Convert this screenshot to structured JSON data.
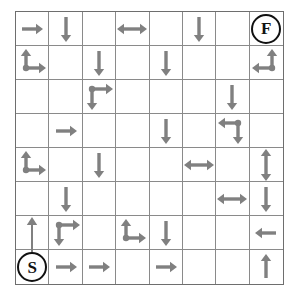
{
  "puzzle": {
    "title": "Arrow Maze",
    "rows": 8,
    "cols": 8,
    "start_label": "S",
    "finish_label": "F",
    "colors": {
      "arrow": "#808080",
      "grid_line": "#8a8a8a",
      "border": "#6e6e6e",
      "marker": "#111111",
      "background": "#ffffff"
    },
    "legend": {
      "right": "right-arrow",
      "left": "left-arrow",
      "up": "up-arrow",
      "down": "down-arrow",
      "left-right": "left-right-double-arrow",
      "up-down": "up-down-double-arrow",
      "up-right": "up-and-right-branch-arrow",
      "up-left": "up-and-left-branch-arrow",
      "down-right": "down-and-right-branch-arrow",
      "left-down": "left-and-down-branch-arrow",
      "up-long": "long-up-arrow",
      "start": "start-marker",
      "finish": "finish-marker",
      "empty": "empty-cell"
    },
    "cells": [
      [
        {
          "r": 1,
          "c": 1,
          "glyph": "right"
        },
        {
          "r": 1,
          "c": 2,
          "glyph": "down"
        },
        {
          "r": 1,
          "c": 3,
          "glyph": "empty"
        },
        {
          "r": 1,
          "c": 4,
          "glyph": "left-right"
        },
        {
          "r": 1,
          "c": 5,
          "glyph": "empty"
        },
        {
          "r": 1,
          "c": 6,
          "glyph": "down"
        },
        {
          "r": 1,
          "c": 7,
          "glyph": "empty"
        },
        {
          "r": 1,
          "c": 8,
          "glyph": "finish",
          "label": "F"
        }
      ],
      [
        {
          "r": 2,
          "c": 1,
          "glyph": "up-right"
        },
        {
          "r": 2,
          "c": 2,
          "glyph": "empty"
        },
        {
          "r": 2,
          "c": 3,
          "glyph": "down"
        },
        {
          "r": 2,
          "c": 4,
          "glyph": "empty"
        },
        {
          "r": 2,
          "c": 5,
          "glyph": "down"
        },
        {
          "r": 2,
          "c": 6,
          "glyph": "empty"
        },
        {
          "r": 2,
          "c": 7,
          "glyph": "empty"
        },
        {
          "r": 2,
          "c": 8,
          "glyph": "up-left"
        }
      ],
      [
        {
          "r": 3,
          "c": 1,
          "glyph": "empty"
        },
        {
          "r": 3,
          "c": 2,
          "glyph": "empty"
        },
        {
          "r": 3,
          "c": 3,
          "glyph": "down-right"
        },
        {
          "r": 3,
          "c": 4,
          "glyph": "empty"
        },
        {
          "r": 3,
          "c": 5,
          "glyph": "empty"
        },
        {
          "r": 3,
          "c": 6,
          "glyph": "empty"
        },
        {
          "r": 3,
          "c": 7,
          "glyph": "down"
        },
        {
          "r": 3,
          "c": 8,
          "glyph": "empty"
        }
      ],
      [
        {
          "r": 4,
          "c": 1,
          "glyph": "empty"
        },
        {
          "r": 4,
          "c": 2,
          "glyph": "right"
        },
        {
          "r": 4,
          "c": 3,
          "glyph": "empty"
        },
        {
          "r": 4,
          "c": 4,
          "glyph": "empty"
        },
        {
          "r": 4,
          "c": 5,
          "glyph": "down"
        },
        {
          "r": 4,
          "c": 6,
          "glyph": "empty"
        },
        {
          "r": 4,
          "c": 7,
          "glyph": "left-down"
        },
        {
          "r": 4,
          "c": 8,
          "glyph": "empty"
        }
      ],
      [
        {
          "r": 5,
          "c": 1,
          "glyph": "up-right"
        },
        {
          "r": 5,
          "c": 2,
          "glyph": "empty"
        },
        {
          "r": 5,
          "c": 3,
          "glyph": "down"
        },
        {
          "r": 5,
          "c": 4,
          "glyph": "empty"
        },
        {
          "r": 5,
          "c": 5,
          "glyph": "empty"
        },
        {
          "r": 5,
          "c": 6,
          "glyph": "left-right"
        },
        {
          "r": 5,
          "c": 7,
          "glyph": "empty"
        },
        {
          "r": 5,
          "c": 8,
          "glyph": "up-down"
        }
      ],
      [
        {
          "r": 6,
          "c": 1,
          "glyph": "empty"
        },
        {
          "r": 6,
          "c": 2,
          "glyph": "down"
        },
        {
          "r": 6,
          "c": 3,
          "glyph": "empty"
        },
        {
          "r": 6,
          "c": 4,
          "glyph": "empty"
        },
        {
          "r": 6,
          "c": 5,
          "glyph": "empty"
        },
        {
          "r": 6,
          "c": 6,
          "glyph": "empty"
        },
        {
          "r": 6,
          "c": 7,
          "glyph": "left-right"
        },
        {
          "r": 6,
          "c": 8,
          "glyph": "down"
        }
      ],
      [
        {
          "r": 7,
          "c": 1,
          "glyph": "up-long"
        },
        {
          "r": 7,
          "c": 2,
          "glyph": "down-right"
        },
        {
          "r": 7,
          "c": 3,
          "glyph": "empty"
        },
        {
          "r": 7,
          "c": 4,
          "glyph": "up-right"
        },
        {
          "r": 7,
          "c": 5,
          "glyph": "down"
        },
        {
          "r": 7,
          "c": 6,
          "glyph": "empty"
        },
        {
          "r": 7,
          "c": 7,
          "glyph": "empty"
        },
        {
          "r": 7,
          "c": 8,
          "glyph": "left"
        }
      ],
      [
        {
          "r": 8,
          "c": 1,
          "glyph": "start",
          "label": "S"
        },
        {
          "r": 8,
          "c": 2,
          "glyph": "right"
        },
        {
          "r": 8,
          "c": 3,
          "glyph": "right"
        },
        {
          "r": 8,
          "c": 4,
          "glyph": "empty"
        },
        {
          "r": 8,
          "c": 5,
          "glyph": "right"
        },
        {
          "r": 8,
          "c": 6,
          "glyph": "empty"
        },
        {
          "r": 8,
          "c": 7,
          "glyph": "empty"
        },
        {
          "r": 8,
          "c": 8,
          "glyph": "up"
        }
      ]
    ]
  }
}
